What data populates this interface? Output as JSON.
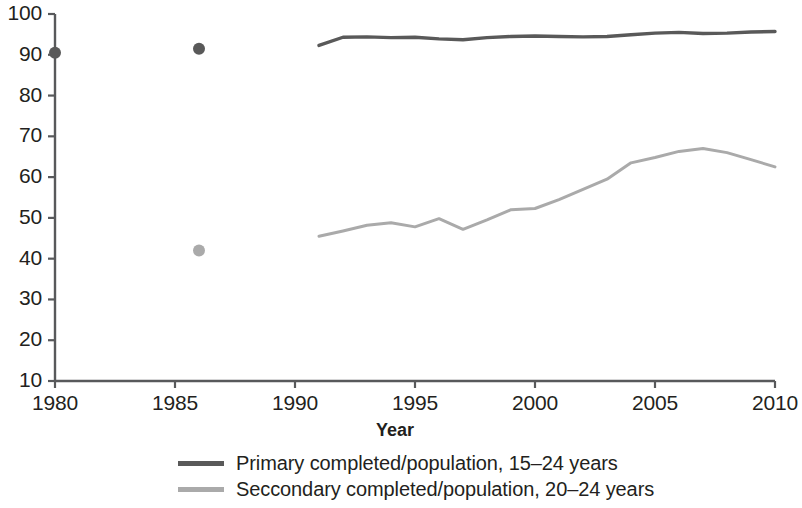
{
  "chart_data": {
    "type": "line",
    "title": "",
    "xlabel": "Year",
    "ylabel": "",
    "xlim": [
      1980,
      2010
    ],
    "ylim": [
      10,
      100
    ],
    "grid": false,
    "legend_position": "bottom",
    "xticks": [
      "1980",
      "1985",
      "1990",
      "1995",
      "2000",
      "2005",
      "2010"
    ],
    "yticks": [
      "10",
      "20",
      "30",
      "40",
      "50",
      "60",
      "70",
      "80",
      "90",
      "100"
    ],
    "series": [
      {
        "name": "Primary completed/population, 15–24 years",
        "color": "#595959",
        "marker_points": [
          {
            "x": 1980,
            "y": 90.5
          },
          {
            "x": 1986,
            "y": 91.5
          }
        ],
        "x": [
          1991,
          1992,
          1993,
          1994,
          1995,
          1996,
          1997,
          1998,
          1999,
          2000,
          2001,
          2002,
          2003,
          2004,
          2005,
          2006,
          2007,
          2008,
          2009,
          2010
        ],
        "values": [
          92.3,
          94.3,
          94.4,
          94.2,
          94.3,
          93.9,
          93.7,
          94.2,
          94.5,
          94.6,
          94.5,
          94.4,
          94.5,
          94.9,
          95.3,
          95.5,
          95.2,
          95.3,
          95.6,
          95.7
        ]
      },
      {
        "name": "Seccondary completed/population, 20–24 years",
        "color": "#aaaaaa",
        "marker_points": [
          {
            "x": 1986,
            "y": 42.0
          }
        ],
        "x": [
          1991,
          1992,
          1993,
          1994,
          1995,
          1996,
          1997,
          1998,
          1999,
          2000,
          2001,
          2002,
          2003,
          2004,
          2005,
          2006,
          2007,
          2008,
          2009,
          2010
        ],
        "values": [
          45.5,
          46.8,
          48.2,
          48.8,
          47.8,
          49.8,
          47.2,
          49.5,
          52.0,
          52.3,
          54.5,
          57.0,
          59.5,
          63.5,
          64.8,
          66.3,
          67.0,
          66.0,
          64.3,
          62.5
        ]
      }
    ]
  },
  "legend": {
    "items": [
      {
        "label": "Primary completed/population, 15–24 years",
        "color": "#595959"
      },
      {
        "label": "Seccondary completed/population, 20–24 years",
        "color": "#aaaaaa"
      }
    ]
  },
  "axis": {
    "x_title": "Year",
    "color": "#58595b"
  }
}
